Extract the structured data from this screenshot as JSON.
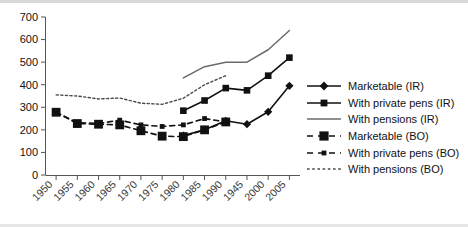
{
  "chart_data": {
    "type": "line",
    "title": "",
    "xlabel": "",
    "ylabel": "",
    "ylim": [
      0,
      700
    ],
    "ytick_step": 100,
    "grid": false,
    "legend_position": "right",
    "categories": [
      "1950",
      "1955",
      "1960",
      "1965",
      "1970",
      "1975",
      "1980",
      "1985",
      "1990",
      "1945",
      "2000",
      "2005"
    ],
    "xtick_labels": [
      "1950",
      "1955",
      "1960",
      "1965",
      "1970",
      "1975",
      "1980",
      "1985",
      "1990",
      "1945",
      "2000",
      "2005"
    ],
    "ytick_labels": [
      "0",
      "100",
      "200",
      "300",
      "400",
      "500",
      "600",
      "700"
    ],
    "series": [
      {
        "name": "Marketable (IR)",
        "style": "solid",
        "marker": "diamond",
        "values": [
          null,
          null,
          null,
          null,
          null,
          null,
          175,
          200,
          240,
          225,
          280,
          395
        ]
      },
      {
        "name": "With private pens (IR)",
        "style": "solid",
        "marker": "square",
        "values": [
          null,
          null,
          null,
          null,
          null,
          null,
          285,
          330,
          385,
          375,
          440,
          520
        ]
      },
      {
        "name": "With pensions (IR)",
        "style": "solid",
        "marker": "none",
        "values": [
          null,
          null,
          null,
          null,
          null,
          null,
          430,
          480,
          500,
          500,
          555,
          640
        ]
      },
      {
        "name": "Marketable (BO)",
        "style": "dashed",
        "marker": "square-large",
        "values": [
          278,
          228,
          225,
          222,
          196,
          172,
          170,
          200,
          235,
          null,
          null,
          null
        ]
      },
      {
        "name": "With private pens (BO)",
        "style": "dashed",
        "marker": "square-small",
        "values": [
          278,
          232,
          228,
          243,
          222,
          215,
          222,
          250,
          235,
          null,
          null,
          null
        ]
      },
      {
        "name": "With pensions (BO)",
        "style": "dotted",
        "marker": "none",
        "values": [
          355,
          350,
          337,
          341,
          318,
          313,
          340,
          400,
          440,
          null,
          null,
          null
        ]
      }
    ]
  },
  "legend": {
    "items": [
      {
        "label": "Marketable (IR)",
        "sample": "solid-diamond"
      },
      {
        "label": "With private pens (IR)",
        "sample": "solid-square"
      },
      {
        "label": "With pensions (IR)",
        "sample": "plain-line"
      },
      {
        "label": "Marketable (BO)",
        "sample": "dashed-square-large"
      },
      {
        "label": "With private pens (BO)",
        "sample": "dashed-square-small"
      },
      {
        "label": "With pensions (BO)",
        "sample": "dotted-line"
      }
    ]
  },
  "colors": {
    "ink": "#111111",
    "axis": "#555555",
    "pensions_ir_line": "#6b6b6b",
    "pensions_bo_line": "#4a4a4a",
    "rule": "#d9d9d9",
    "background": "#ffffff"
  }
}
